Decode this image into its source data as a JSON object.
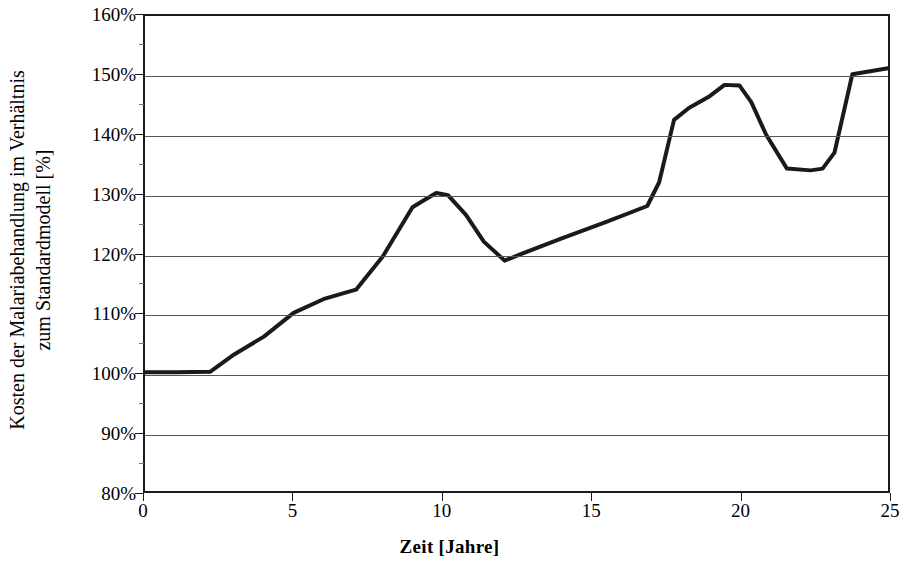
{
  "chart_data": {
    "type": "line",
    "title": "",
    "xlabel": "Zeit [Jahre]",
    "ylabel": "Kosten der Malariabehandlung im Verhältnis zum Standardmodell [%]",
    "ylabel_lines": [
      "Kosten der Malariabehandlung im Verhältnis",
      "zum Standardmodell [%]"
    ],
    "xlim": [
      0,
      25
    ],
    "ylim": [
      80,
      160
    ],
    "grid": true,
    "legend": "none",
    "x_ticks": [
      0,
      5,
      10,
      15,
      20,
      25
    ],
    "x_tick_labels": [
      "0",
      "5",
      "10",
      "15",
      "20",
      "25"
    ],
    "y_ticks": [
      80,
      90,
      100,
      110,
      120,
      130,
      140,
      150,
      160
    ],
    "y_tick_labels": [
      "80%",
      "90%",
      "100%",
      "110%",
      "120%",
      "130%",
      "140%",
      "150%",
      "160%"
    ],
    "series": [
      {
        "name": "Kosten der Malariabehandlung",
        "color": "#1a1a1a",
        "line_width": 4,
        "x": [
          0.0,
          1.0,
          2.2,
          3.0,
          4.0,
          5.0,
          6.0,
          6.6,
          7.1,
          8.0,
          9.0,
          9.4,
          9.8,
          10.2,
          10.8,
          11.4,
          12.1,
          12.6,
          14.0,
          15.5,
          16.9,
          17.3,
          17.8,
          18.3,
          19.0,
          19.5,
          20.0,
          20.4,
          20.9,
          21.6,
          22.4,
          22.8,
          23.2,
          23.8,
          25.0
        ],
        "y": [
          100.0,
          100.0,
          100.1,
          103.0,
          106.0,
          110.0,
          112.3,
          113.2,
          113.9,
          119.5,
          127.8,
          129.0,
          130.2,
          129.8,
          126.5,
          122.0,
          118.8,
          119.8,
          122.5,
          125.3,
          128.0,
          132.0,
          142.5,
          144.5,
          146.5,
          148.4,
          148.3,
          145.5,
          140.0,
          134.3,
          134.0,
          134.3,
          137.0,
          150.2,
          151.2
        ]
      }
    ]
  },
  "axes": {
    "y_title_line_1": "Kosten der Malariabehandlung im Verhältnis",
    "y_title_line_2": "zum Standardmodell [%]",
    "x_title": "Zeit [Jahre]"
  }
}
